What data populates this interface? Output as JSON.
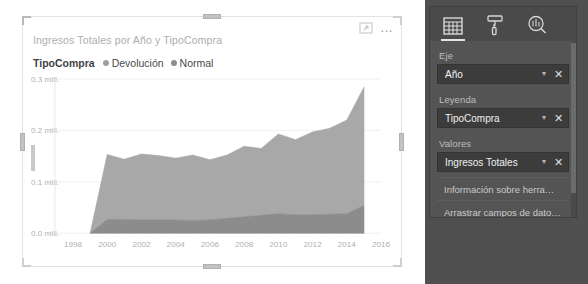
{
  "visual": {
    "title": "Ingresos Totales por Año y TipoCompra",
    "focus_icon": "focus-mode-icon",
    "more_options_label": "…",
    "legend": {
      "title": "TipoCompra",
      "items": [
        {
          "label": "Devolución",
          "color": "#9e9e9e"
        },
        {
          "label": "Normal",
          "color": "#8c8c8c"
        }
      ]
    }
  },
  "chart_data": {
    "type": "area",
    "title": "Ingresos Totales por Año y TipoCompra",
    "xlabel": "Año",
    "ylabel": "Ingresos Totales",
    "stacked": true,
    "grid": true,
    "legend_position": "top",
    "xlim": [
      1997,
      2016
    ],
    "ylim": [
      0,
      300000
    ],
    "ytick_labels": [
      "0.3 mill.",
      "0.2 mill.",
      "0.1 mill.",
      "0.0 mill."
    ],
    "ytick_values": [
      300000,
      200000,
      100000,
      0
    ],
    "xtick_labels": [
      "1998",
      "2000",
      "2002",
      "2004",
      "2006",
      "2008",
      "2010",
      "2012",
      "2014",
      "2016"
    ],
    "xtick_values": [
      1998,
      2000,
      2002,
      2004,
      2006,
      2008,
      2010,
      2012,
      2014,
      2016
    ],
    "x": [
      1999,
      2000,
      2001,
      2002,
      2003,
      2004,
      2005,
      2006,
      2007,
      2008,
      2009,
      2010,
      2011,
      2012,
      2013,
      2014,
      2015
    ],
    "series": [
      {
        "name": "Devolución",
        "color": "#8c8c8c",
        "values": [
          0,
          27000,
          27000,
          26000,
          26000,
          26000,
          25000,
          26000,
          29000,
          32000,
          35000,
          38000,
          36000,
          36000,
          37000,
          38000,
          54000
        ]
      },
      {
        "name": "Normal",
        "color": "#a8a8a8",
        "values": [
          0,
          126000,
          117000,
          128000,
          125000,
          120000,
          127000,
          117000,
          123000,
          137000,
          130000,
          155000,
          146000,
          161000,
          167000,
          182000,
          230000
        ]
      }
    ]
  },
  "pane": {
    "tabs": [
      {
        "name": "fields-tab",
        "icon": "table-grid-icon",
        "active": true
      },
      {
        "name": "format-tab",
        "icon": "paint-roller-icon",
        "active": false
      },
      {
        "name": "analytics-tab",
        "icon": "magnifier-chart-icon",
        "active": false
      }
    ],
    "wells": [
      {
        "label": "Eje",
        "value": "Año"
      },
      {
        "label": "Leyenda",
        "value": "TipoCompra"
      },
      {
        "label": "Valores",
        "value": "Ingresos Totales"
      }
    ],
    "drop_rows": [
      {
        "text": "Información sobre herramien…"
      },
      {
        "text": "Arrastrar campos de datos …"
      }
    ],
    "caret_glyph": "▾",
    "remove_glyph": "✕"
  }
}
